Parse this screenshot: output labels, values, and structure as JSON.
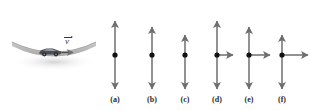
{
  "figure": {
    "background_color": "#ffffff",
    "arrow_color": "#6e6e6e",
    "dot_color": "#111111",
    "road_color": "#b4b4b4",
    "car_color": "#4a4a4a"
  },
  "scene": {
    "name": "car-on-dip",
    "velocity_label": "v",
    "velocity_symbol_name": "vector-v-with-overarrow",
    "road_shape": "concave-up-dip",
    "car_direction": "right"
  },
  "choices": [
    {
      "label": "(a)",
      "center_x": 115,
      "center_y": 55,
      "up_length": 34,
      "down_length": 34,
      "right_length": 0,
      "has_horizontal": false
    },
    {
      "label": "(b)",
      "center_x": 152,
      "center_y": 55,
      "up_length": 28,
      "down_length": 34,
      "right_length": 0,
      "has_horizontal": false
    },
    {
      "label": "(c)",
      "center_x": 185,
      "center_y": 55,
      "up_length": 20,
      "down_length": 34,
      "right_length": 0,
      "has_horizontal": false
    },
    {
      "label": "(d)",
      "center_x": 217,
      "center_y": 55,
      "up_length": 34,
      "down_length": 34,
      "right_length": 16,
      "has_horizontal": true
    },
    {
      "label": "(e)",
      "center_x": 249,
      "center_y": 55,
      "up_length": 28,
      "down_length": 34,
      "right_length": 21,
      "has_horizontal": true
    },
    {
      "label": "(f)",
      "center_x": 282,
      "center_y": 55,
      "up_length": 20,
      "down_length": 34,
      "right_length": 26,
      "has_horizontal": true
    }
  ],
  "chart_data": {
    "type": "diagram",
    "categories": [
      "(a)",
      "(b)",
      "(c)",
      "(d)",
      "(e)",
      "(f)"
    ],
    "series": [
      {
        "name": "up-arrow-length",
        "values": [
          34,
          28,
          20,
          34,
          28,
          20
        ]
      },
      {
        "name": "down-arrow-length",
        "values": [
          34,
          34,
          34,
          34,
          34,
          34
        ]
      },
      {
        "name": "right-arrow-length",
        "values": [
          0,
          0,
          0,
          16,
          21,
          26
        ]
      }
    ],
    "xlabel": "",
    "ylabel": "arrow length (px)",
    "legend": [
      "up",
      "down",
      "right"
    ]
  }
}
